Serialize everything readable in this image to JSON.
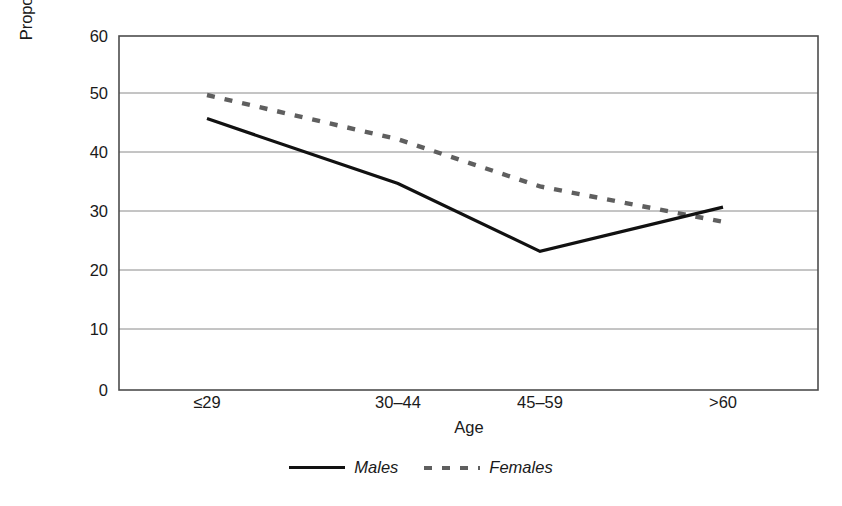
{
  "chart_data": {
    "type": "line",
    "title": "",
    "xlabel": "Age",
    "ylabel": "Proportion of patients with a Bipolar II Disorder",
    "categories": [
      "≤29",
      "30–44",
      "45–59",
      ">60"
    ],
    "yticks": [
      0,
      10,
      20,
      30,
      40,
      50,
      60
    ],
    "ylim": [
      0,
      60
    ],
    "grid": "horizontal",
    "legend_position": "bottom",
    "series": [
      {
        "name": "Males",
        "style": "solid",
        "color": "#111111",
        "values": [
          46,
          35,
          23.5,
          31
        ]
      },
      {
        "name": "Females",
        "style": "dashed",
        "color": "#5f5f5f",
        "values": [
          50,
          42.5,
          34.5,
          28.5
        ]
      }
    ]
  },
  "axis": {
    "ylabel_line1": "Proportion of patients with a Bipolar II",
    "ylabel_line2": "Disorder",
    "xlabel": "Age",
    "ytick_labels": [
      "60",
      "50",
      "40",
      "30",
      "20",
      "10",
      "0"
    ],
    "xtick_labels": [
      "≤29",
      "30–44",
      "45–59",
      ">60"
    ]
  },
  "legend": {
    "items": [
      {
        "label": "Males",
        "swatch": "solid-line-swatch"
      },
      {
        "label": "Females",
        "swatch": "dashed-line-swatch"
      }
    ]
  },
  "colors": {
    "males_line": "#111111",
    "females_line": "#5f5f5f",
    "gridline": "#8a8a8a",
    "frame": "#4d4d4d",
    "background": "#ffffff"
  }
}
